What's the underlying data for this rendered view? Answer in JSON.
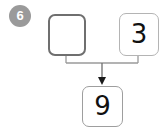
{
  "problem": {
    "number_badge": "6",
    "badge_color": "#9a9a9a",
    "badge_text_color": "#ffffff"
  },
  "diagram": {
    "type": "number-bond-fact-family",
    "addend_left": {
      "label": "",
      "is_blank": true,
      "border_color": "#6f6f6f"
    },
    "addend_right": {
      "label": "3",
      "is_blank": false,
      "border_color": "#b4b4b4"
    },
    "sum": {
      "label": "9",
      "is_blank": false,
      "border_color": "#9e9e9e"
    },
    "connector": {
      "line_color": "#9a9a9a",
      "arrow_color": "#1a1a1a",
      "arrow_direction": "down"
    }
  }
}
